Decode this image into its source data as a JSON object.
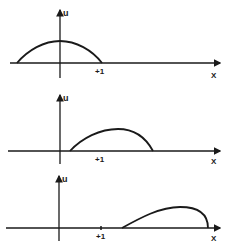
{
  "figure": {
    "colors": {
      "stroke": "#1a1a1a",
      "background": "#ffffff"
    },
    "panels": [
      {
        "id": "panel-1",
        "y_axis_label": "u",
        "x_axis_label": "X",
        "tick_label": "+1",
        "curve": "symmetric hump centered on u-axis, from about x=-1 to x=+1"
      },
      {
        "id": "panel-2",
        "y_axis_label": "u",
        "x_axis_label": "X",
        "tick_label": "+1",
        "curve": "hump shifted right, front becoming steeper"
      },
      {
        "id": "panel-3",
        "y_axis_label": "u",
        "x_axis_label": "X",
        "tick_label": "+1",
        "curve": "hump shifted further right, front nearly vertical (shock forming)"
      }
    ]
  }
}
